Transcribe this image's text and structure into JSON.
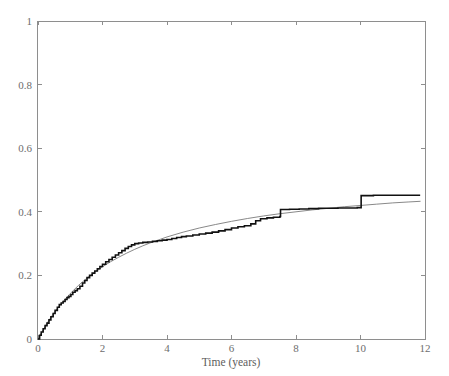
{
  "chart_data": {
    "type": "line",
    "title": "",
    "subtitle": "",
    "xlabel": "Time (years)",
    "ylabel": "",
    "xlim": [
      0,
      12
    ],
    "ylim": [
      0,
      1
    ],
    "xticks": [
      0,
      2,
      4,
      6,
      8,
      10,
      12
    ],
    "xticklabels": [
      "0",
      "2",
      "4",
      "6",
      "8",
      "10",
      "12"
    ],
    "yticks": [
      0,
      0.2,
      0.4,
      0.6,
      0.8,
      1
    ],
    "yticklabels": [
      "0",
      "0.2",
      "0.4",
      "0.6",
      "0.8",
      "1"
    ],
    "grid": false,
    "legend": "none",
    "box": true,
    "annotations": [],
    "series": [
      {
        "name": "empirical-step-estimate",
        "style": "step",
        "color": "#111111",
        "x": [
          0,
          0.05,
          0.1,
          0.16,
          0.22,
          0.28,
          0.34,
          0.4,
          0.47,
          0.53,
          0.6,
          0.66,
          0.72,
          0.78,
          0.84,
          0.9,
          0.96,
          1.02,
          1.08,
          1.15,
          1.22,
          1.3,
          1.38,
          1.45,
          1.52,
          1.6,
          1.68,
          1.76,
          1.84,
          1.92,
          2.0,
          2.1,
          2.2,
          2.3,
          2.4,
          2.5,
          2.6,
          2.7,
          2.8,
          2.9,
          3.0,
          3.12,
          3.25,
          3.4,
          3.55,
          3.7,
          3.85,
          4.0,
          4.15,
          4.3,
          4.45,
          4.6,
          4.8,
          5.0,
          5.2,
          5.4,
          5.6,
          5.8,
          6.0,
          6.2,
          6.4,
          6.6,
          6.75,
          6.9,
          7.1,
          7.3,
          7.5,
          7.52,
          7.8,
          8.1,
          8.4,
          8.7,
          9.0,
          9.3,
          9.6,
          9.9,
          10.02,
          10.4,
          10.9,
          11.4,
          11.85
        ],
        "y": [
          0.0,
          0.012,
          0.022,
          0.032,
          0.042,
          0.05,
          0.06,
          0.07,
          0.08,
          0.09,
          0.1,
          0.108,
          0.113,
          0.118,
          0.124,
          0.13,
          0.134,
          0.14,
          0.147,
          0.152,
          0.158,
          0.166,
          0.176,
          0.184,
          0.193,
          0.2,
          0.207,
          0.214,
          0.221,
          0.228,
          0.235,
          0.243,
          0.25,
          0.257,
          0.264,
          0.271,
          0.278,
          0.285,
          0.291,
          0.296,
          0.3,
          0.302,
          0.304,
          0.305,
          0.307,
          0.309,
          0.311,
          0.313,
          0.316,
          0.319,
          0.322,
          0.324,
          0.327,
          0.33,
          0.333,
          0.336,
          0.34,
          0.344,
          0.349,
          0.353,
          0.356,
          0.362,
          0.372,
          0.378,
          0.381,
          0.383,
          0.385,
          0.407,
          0.408,
          0.409,
          0.41,
          0.411,
          0.411,
          0.412,
          0.412,
          0.413,
          0.451,
          0.452,
          0.452,
          0.452,
          0.452
        ]
      },
      {
        "name": "fitted-smooth-model",
        "style": "line",
        "color": "#7a7a7a",
        "x": [
          0,
          0.25,
          0.5,
          0.75,
          1.0,
          1.25,
          1.5,
          1.75,
          2.0,
          2.25,
          2.5,
          2.75,
          3.0,
          3.25,
          3.5,
          3.75,
          4.0,
          4.5,
          5.0,
          5.5,
          6.0,
          6.5,
          7.0,
          7.5,
          8.0,
          8.5,
          9.0,
          9.5,
          10.0,
          10.5,
          11.0,
          11.5,
          11.85
        ],
        "y": [
          0.0,
          0.045,
          0.083,
          0.115,
          0.143,
          0.168,
          0.19,
          0.209,
          0.227,
          0.243,
          0.257,
          0.27,
          0.282,
          0.293,
          0.303,
          0.312,
          0.321,
          0.336,
          0.349,
          0.36,
          0.37,
          0.379,
          0.387,
          0.394,
          0.4,
          0.406,
          0.411,
          0.416,
          0.42,
          0.424,
          0.428,
          0.431,
          0.433
        ]
      }
    ]
  },
  "axes": {
    "x_axis_name": "time-axis",
    "y_axis_name": "probability-axis"
  }
}
